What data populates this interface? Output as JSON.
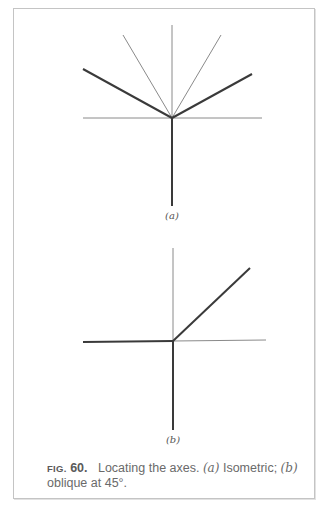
{
  "figure": {
    "number_prefix": "FIG.",
    "number": "60.",
    "caption_text_1": "Locating the axes.",
    "caption_a_label": "(a)",
    "caption_a_text": "Isometric;",
    "caption_b_label": "(b)",
    "caption_b_text": "oblique at 45°."
  },
  "panels": [
    {
      "label": "(a)",
      "type": "isometric",
      "thick_lines": [
        [
          83,
          69,
          172,
          118
        ],
        [
          172,
          118,
          252,
          74
        ],
        [
          172,
          118,
          172,
          206
        ]
      ],
      "thin_lines": [
        [
          172,
          25,
          172,
          118
        ],
        [
          123,
          35,
          172,
          118
        ],
        [
          172,
          118,
          221,
          35
        ],
        [
          83,
          118,
          262,
          118
        ]
      ]
    },
    {
      "label": "(b)",
      "type": "oblique at 45°",
      "thick_lines": [
        [
          83,
          342,
          173,
          341
        ],
        [
          173,
          341,
          250,
          268
        ],
        [
          173,
          341,
          173,
          430
        ]
      ],
      "thin_lines": [
        [
          173,
          248,
          173,
          341
        ],
        [
          173,
          341,
          266,
          340
        ]
      ]
    }
  ],
  "colors": {
    "line": "#3a3a3a",
    "thin_line": "#8a8a8a",
    "border": "#c4c4c4",
    "caption": "#6a6a6a"
  }
}
